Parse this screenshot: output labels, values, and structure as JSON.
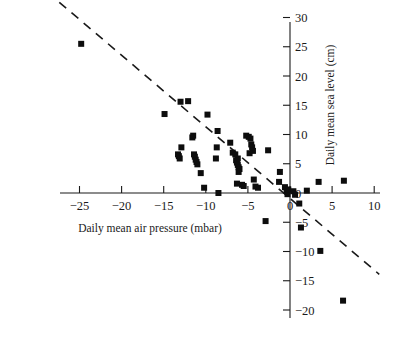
{
  "chart_data": {
    "type": "scatter",
    "title": "",
    "subtitle": "",
    "xlabel": "Daily mean air pressure (mbar)",
    "ylabel": "Daily mean sea level (cm)",
    "xlim": [
      -27.5,
      11.5
    ],
    "ylim": [
      -21.5,
      31.5
    ],
    "xticks": [
      -25,
      -20,
      -15,
      -10,
      -5,
      0,
      5,
      10
    ],
    "xtick_labels": [
      "−25",
      "−20",
      "−15",
      "−10",
      "−5",
      "0",
      "5",
      "10"
    ],
    "yticks": [
      30,
      25,
      20,
      15,
      10,
      5,
      0,
      -5,
      -10,
      -15,
      -20
    ],
    "ytick_labels": [
      "30",
      "25",
      "20",
      "15",
      "10",
      "5",
      "0",
      "−5",
      "−10",
      "−15",
      "−20"
    ],
    "grid": false,
    "legend": null,
    "yaxis_position": "right",
    "xaxis_position": "zero",
    "marker": "square",
    "marker_color": "#0d0d0d",
    "marker_size_px": 6,
    "points": [
      [
        -24.8,
        25.5
      ],
      [
        -14.9,
        13.5
      ],
      [
        -13.0,
        15.6
      ],
      [
        -12.1,
        15.7
      ],
      [
        -12.9,
        7.8
      ],
      [
        -11.6,
        9.5
      ],
      [
        -11.5,
        9.8
      ],
      [
        -13.2,
        6.3
      ],
      [
        -13.1,
        5.9
      ],
      [
        -13.3,
        6.6
      ],
      [
        -11.3,
        6.2
      ],
      [
        -11.2,
        5.7
      ],
      [
        -11.1,
        5.3
      ],
      [
        -11.0,
        4.9
      ],
      [
        -11.4,
        6.6
      ],
      [
        -10.6,
        3.4
      ],
      [
        -10.2,
        0.9
      ],
      [
        -9.8,
        13.4
      ],
      [
        -8.6,
        10.6
      ],
      [
        -8.7,
        7.8
      ],
      [
        -8.8,
        5.9
      ],
      [
        -8.5,
        0.0
      ],
      [
        -7.1,
        8.6
      ],
      [
        -6.8,
        6.9
      ],
      [
        -6.4,
        5.6
      ],
      [
        -6.3,
        5.2
      ],
      [
        -6.2,
        4.8
      ],
      [
        -6.1,
        4.4
      ],
      [
        -6.0,
        4.1
      ],
      [
        -6.2,
        5.9
      ],
      [
        -6.5,
        6.6
      ],
      [
        -6.1,
        3.6
      ],
      [
        -6.3,
        1.6
      ],
      [
        -5.7,
        1.4
      ],
      [
        -5.5,
        1.2
      ],
      [
        -5.2,
        9.8
      ],
      [
        -4.9,
        9.6
      ],
      [
        -4.7,
        9.3
      ],
      [
        -4.6,
        8.3
      ],
      [
        -4.5,
        7.8
      ],
      [
        -4.4,
        7.2
      ],
      [
        -4.8,
        6.8
      ],
      [
        -4.3,
        2.3
      ],
      [
        -4.1,
        1.1
      ],
      [
        -3.8,
        0.9
      ],
      [
        -2.6,
        7.3
      ],
      [
        -1.2,
        3.6
      ],
      [
        -1.3,
        1.9
      ],
      [
        -0.6,
        1.0
      ],
      [
        -0.4,
        0.4
      ],
      [
        -0.3,
        -0.2
      ],
      [
        -0.2,
        0.6
      ],
      [
        0.4,
        0.3
      ],
      [
        0.6,
        -0.3
      ],
      [
        1.1,
        -1.8
      ],
      [
        1.3,
        -5.9
      ],
      [
        2.0,
        0.4
      ],
      [
        3.4,
        1.9
      ],
      [
        6.4,
        2.1
      ],
      [
        3.6,
        -9.9
      ],
      [
        6.3,
        -18.4
      ],
      [
        -2.9,
        -4.8
      ]
    ],
    "trendline": {
      "style": "dashed",
      "color": "#1a1a1a",
      "x_start": -27.4,
      "y_start": 32.6,
      "x_end": 10.6,
      "y_end": -13.9,
      "description": "dashed negative-slope fitted line"
    }
  },
  "axes": {
    "x_axis_name": "x-axis",
    "y_axis_name": "y-axis"
  }
}
